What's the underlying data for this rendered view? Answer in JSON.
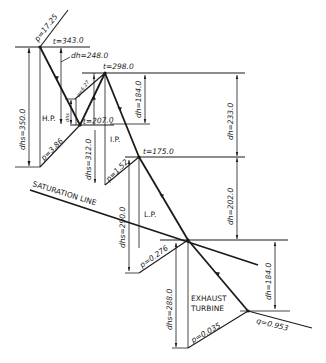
{
  "diagram": {
    "type": "Mollier (h-s) diagram of steam expansion with reheat",
    "stages": {
      "hp": "H.P.",
      "ip": "I.P.",
      "lp": "L.P.",
      "exhaust_line1": "EXHAUST",
      "exhaust_line2": "TURBINE"
    },
    "saturation_line": "SATURATION LINE",
    "pressures": {
      "p1": "p=17.25",
      "p2": "p=3.86",
      "p3": "p=6.27",
      "p4": "p=1.52",
      "p5": "p=0.276",
      "p6": "p=0.035"
    },
    "temperatures": {
      "t1": "t=343.0",
      "t2": "t=298.0",
      "t3": "t=207.0",
      "t4": "t=175.0"
    },
    "enthalpy_drops": {
      "dh_hp": "dh=248.0",
      "dh_ip": "dh=184.0",
      "dh_total1": "dh=233.0",
      "dh_lp": "dh=202.0",
      "dh_exh": "dh=184.0"
    },
    "isentropic_drops": {
      "dhs_hp": "dhs=350.0",
      "dhs_reheat": "dhs",
      "dhs_ip": "dhs=312.0",
      "dhs_lp": "dhs=290.0",
      "dhs_exh": "dhs=288.0"
    },
    "quality": "q=0.953"
  }
}
